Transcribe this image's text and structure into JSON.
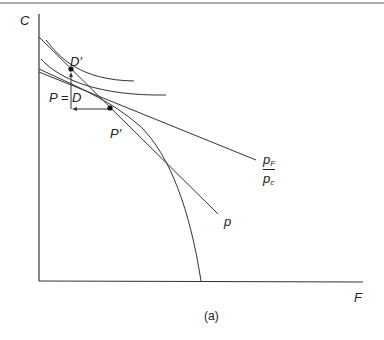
{
  "figure": {
    "caption": "(a)",
    "axes": {
      "y_label": "C",
      "x_label": "F"
    },
    "points": {
      "d_prime": "D′",
      "p_equals_d": "P = D",
      "p_prime": "P′"
    },
    "lines": {
      "price_line_p": "p",
      "relative_price_num": "p",
      "relative_price_num_sub": "F",
      "relative_price_den": "p",
      "relative_price_den_sub": "c"
    },
    "colors": {
      "ink": "#333333",
      "background": "#ffffff"
    }
  }
}
